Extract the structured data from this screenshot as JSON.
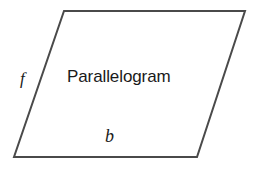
{
  "figure": {
    "type": "geometry-diagram",
    "shape": "parallelogram",
    "background_color": "#ffffff",
    "stroke_color": "#4a4a4a",
    "stroke_width": 2,
    "text_color": "#1a1a1a",
    "shape_label": "Parallelogram",
    "side_labels": [
      {
        "id": "f",
        "text": "f",
        "side": "left-slant",
        "style": "italic"
      },
      {
        "id": "b",
        "text": "b",
        "side": "bottom-base",
        "style": "italic"
      }
    ],
    "vertices": {
      "top_left": [
        64,
        11
      ],
      "top_right": [
        245,
        11
      ],
      "bottom_right": [
        197,
        157
      ],
      "bottom_left": [
        14,
        157
      ]
    },
    "polygon_points": "64,11 245,11 197,157 14,157"
  }
}
